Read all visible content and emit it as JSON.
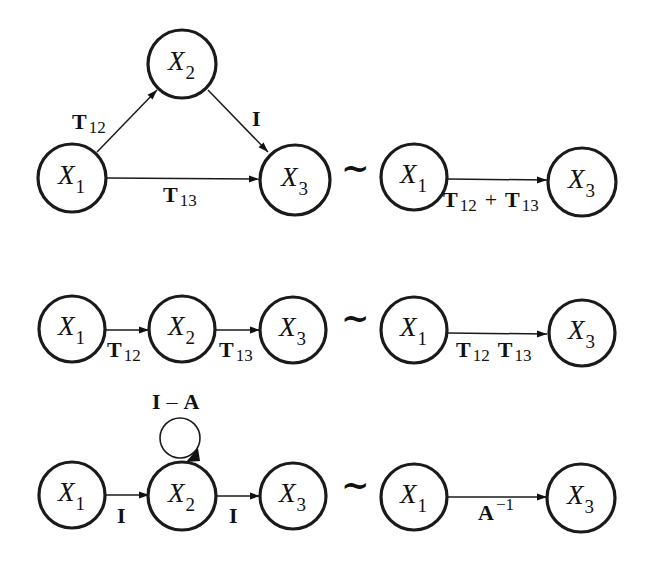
{
  "figure": {
    "equivalence_symbol": "~",
    "rows": [
      {
        "id": "parallel",
        "left": {
          "nodes": [
            {
              "var": "X",
              "sub": "1"
            },
            {
              "var": "X",
              "sub": "2"
            },
            {
              "var": "X",
              "sub": "3"
            }
          ],
          "edges": [
            {
              "from": "X1",
              "to": "X2",
              "label": "T",
              "label_sub": "12"
            },
            {
              "from": "X2",
              "to": "X3",
              "label": "I",
              "label_sub": ""
            },
            {
              "from": "X1",
              "to": "X3",
              "label": "T",
              "label_sub": "13"
            }
          ]
        },
        "right": {
          "nodes": [
            {
              "var": "X",
              "sub": "1"
            },
            {
              "var": "X",
              "sub": "3"
            }
          ],
          "edge": {
            "from": "X1",
            "to": "X3",
            "label_a": "T",
            "label_a_sub": "12",
            "operator": "+",
            "label_b": "T",
            "label_b_sub": "13"
          }
        }
      },
      {
        "id": "series",
        "left": {
          "nodes": [
            {
              "var": "X",
              "sub": "1"
            },
            {
              "var": "X",
              "sub": "2"
            },
            {
              "var": "X",
              "sub": "3"
            }
          ],
          "edges": [
            {
              "from": "X1",
              "to": "X2",
              "label": "T",
              "label_sub": "12"
            },
            {
              "from": "X2",
              "to": "X3",
              "label": "T",
              "label_sub": "13"
            }
          ]
        },
        "right": {
          "nodes": [
            {
              "var": "X",
              "sub": "1"
            },
            {
              "var": "X",
              "sub": "3"
            }
          ],
          "edge": {
            "from": "X1",
            "to": "X3",
            "label_a": "T",
            "label_a_sub": "12",
            "label_b": "T",
            "label_b_sub": "13"
          }
        }
      },
      {
        "id": "feedback-loop",
        "left": {
          "nodes": [
            {
              "var": "X",
              "sub": "1"
            },
            {
              "var": "X",
              "sub": "2"
            },
            {
              "var": "X",
              "sub": "3"
            }
          ],
          "self_loop": {
            "node": "X2",
            "label_a": "I",
            "operator": "–",
            "label_b": "A"
          },
          "edges": [
            {
              "from": "X1",
              "to": "X2",
              "label": "I",
              "label_sub": ""
            },
            {
              "from": "X2",
              "to": "X3",
              "label": "I",
              "label_sub": ""
            }
          ]
        },
        "right": {
          "nodes": [
            {
              "var": "X",
              "sub": "1"
            },
            {
              "var": "X",
              "sub": "3"
            }
          ],
          "edge": {
            "from": "X1",
            "to": "X3",
            "label": "A",
            "label_sup": "−1"
          }
        }
      }
    ]
  }
}
